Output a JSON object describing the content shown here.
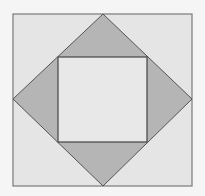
{
  "diagram": {
    "colors": {
      "background": "#f5f5f5",
      "outer_fill": "#e5e5e5",
      "stroke": "#7a7a7a",
      "diamond_fill": "#b5b5b5",
      "inner_fill": "#e8e8e8"
    },
    "outer_square": {
      "x": 13,
      "y": 14,
      "width": 179,
      "height": 172
    },
    "diamond": {
      "points": "103,14 192,99 103,186 13,99"
    },
    "inner_square": {
      "x": 58,
      "y": 57,
      "width": 89,
      "height": 85
    }
  }
}
